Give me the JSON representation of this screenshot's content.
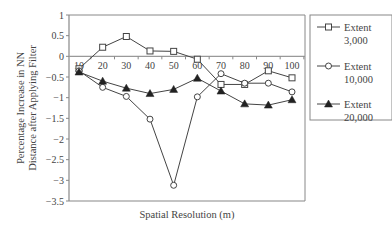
{
  "chart_data": {
    "type": "line",
    "title": "",
    "xlabel": "Spatial Resolution (m)",
    "ylabel": "Percentage Increase in NN Distance after Applying Filter",
    "ylabel_lines": [
      "Percentage Increase in NN",
      "Distance after Applying Filter"
    ],
    "x": [
      10,
      20,
      30,
      40,
      50,
      60,
      70,
      80,
      90,
      100
    ],
    "x_tick_labels": [
      "10",
      "20",
      "30",
      "40",
      "50",
      "60",
      "70",
      "80",
      "90",
      "100"
    ],
    "ylim": [
      -3.5,
      1
    ],
    "y_ticks": [
      1,
      0.5,
      0,
      -0.5,
      -1,
      -1.5,
      -2,
      -2.5,
      -3,
      -3.5
    ],
    "y_tick_labels": [
      "1",
      "0.5",
      "0",
      "−0.5",
      "−1",
      "−1.5",
      "−2",
      "−2.5",
      "−3",
      "−3.5"
    ],
    "grid": false,
    "legend_position": "right",
    "series": [
      {
        "name": "Extent 3,000",
        "label_lines": [
          "Extent",
          "3,000"
        ],
        "marker": "square-open",
        "values": [
          -0.3,
          0.22,
          0.48,
          0.13,
          0.12,
          -0.07,
          -0.68,
          -0.68,
          -0.35,
          -0.52
        ]
      },
      {
        "name": "Extent 10,000",
        "label_lines": [
          "Extent",
          "10,000"
        ],
        "marker": "circle-open",
        "values": [
          -0.35,
          -0.75,
          -0.97,
          -1.52,
          -3.12,
          -0.98,
          -0.42,
          -0.65,
          -0.65,
          -0.86
        ]
      },
      {
        "name": "Extent 20,000",
        "label_lines": [
          "Extent",
          "20,000"
        ],
        "marker": "triangle-filled",
        "values": [
          -0.38,
          -0.6,
          -0.77,
          -0.9,
          -0.8,
          -0.53,
          -0.84,
          -1.15,
          -1.18,
          -1.05
        ]
      }
    ]
  },
  "colors": {
    "line": "#444444",
    "axis": "#888888",
    "zero_line": "#999999",
    "frame": "#888888"
  }
}
